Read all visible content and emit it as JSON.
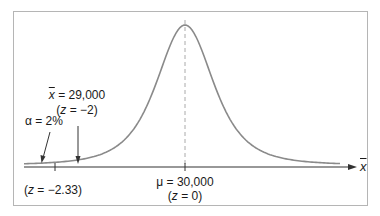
{
  "chart_data": {
    "type": "line",
    "title": "",
    "xlabel": "x̄",
    "ylabel": "",
    "grid": false,
    "legend": null,
    "mean": {
      "symbol": "μ",
      "value": 30000,
      "z": 0
    },
    "critical_value": {
      "z": -2.33,
      "alpha_percent": 2
    },
    "observed": {
      "symbol": "x̄",
      "value": 29000,
      "z": -2
    },
    "annotations": [
      "α = 2%",
      "x̄ = 29,000",
      "(z = −2)",
      "(z = −2.33)",
      "μ = 30,000",
      "(z = 0)"
    ]
  },
  "labels": {
    "alpha": "α = 2%",
    "xbar_sym": "x",
    "xbar_value": " = 29,000",
    "xbar_z_open": "(",
    "z": "z",
    "xbar_z_rest": " = −2)",
    "crit_z_open": "(",
    "crit_z_rest": " = −2.33)",
    "mu_value": "μ = 30,000",
    "mu_z_open": "(",
    "mu_z_rest": " = 0)",
    "axis_label": "x"
  },
  "colors": {
    "curve": "#8a8a8a",
    "axis": "#333333",
    "frame": "#b5b5b5",
    "dashed": "#aaaaaa",
    "text": "#1a1a1a"
  }
}
